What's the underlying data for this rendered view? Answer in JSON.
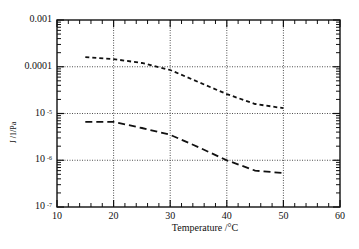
{
  "chart_data": {
    "type": "line",
    "title": "",
    "xlabel": "Temperature   /°C",
    "ylabel": "J   /1/Pa",
    "xlim": [
      10,
      60
    ],
    "ylim": [
      1e-07,
      0.001
    ],
    "yscale": "log",
    "grid": true,
    "legend": null,
    "x_ticks": [
      "10",
      "20",
      "30",
      "40",
      "50",
      "60"
    ],
    "y_ticks": [
      {
        "base": "0.001",
        "exp": ""
      },
      {
        "base": "0.0001",
        "exp": ""
      },
      {
        "base": "10",
        "exp": "-5"
      },
      {
        "base": "10",
        "exp": "-6"
      },
      {
        "base": "10",
        "exp": "-7"
      }
    ],
    "x": [
      15,
      20,
      25,
      30,
      35,
      40,
      45,
      50
    ],
    "series": [
      {
        "name": "upper (short dash)",
        "style": "short-dash",
        "values": [
          0.00016,
          0.000146,
          0.00012,
          8.5e-05,
          4.7e-05,
          2.6e-05,
          1.6e-05,
          1.3e-05
        ]
      },
      {
        "name": "lower (long dash)",
        "style": "long-dash",
        "values": [
          6.6e-06,
          6.6e-06,
          4.9e-06,
          3.5e-06,
          1.9e-06,
          1e-06,
          6e-07,
          5.3e-07
        ]
      }
    ]
  },
  "labels": {
    "x_title": "Temperature   /°C",
    "y_title": "J   /1/Pa"
  }
}
